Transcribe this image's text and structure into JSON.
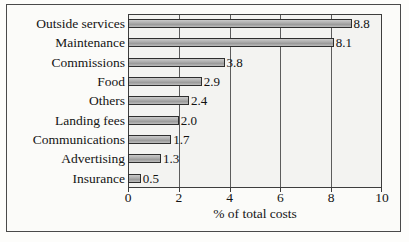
{
  "chart_data": {
    "type": "bar",
    "orientation": "horizontal",
    "title": "",
    "xlabel": "% of total costs",
    "ylabel": "",
    "xlim": [
      0,
      10
    ],
    "xticks": [
      0,
      2,
      4,
      6,
      8,
      10
    ],
    "xtick_labels": [
      "0",
      "2",
      "4",
      "6",
      "8",
      "10"
    ],
    "gridlines": [
      2,
      4,
      6,
      8
    ],
    "grid": true,
    "legend": false,
    "categories": [
      "Outside services",
      "Maintenance",
      "Commissions",
      "Food",
      "Others",
      "Landing fees",
      "Communications",
      "Advertising",
      "Insurance"
    ],
    "values": [
      8.8,
      8.1,
      3.8,
      2.9,
      2.4,
      2.0,
      1.7,
      1.3,
      0.5
    ],
    "value_labels": [
      "8.8",
      "8.1",
      "3.8",
      "2.9",
      "2.4",
      "2.0",
      "1.7",
      "1.3",
      "0.5"
    ],
    "colors": {
      "bar_fill": "#b2b2b2",
      "bar_edge": "#2e2e2e",
      "plot_background": "#f3f3f1",
      "figure_background": "#fbfbf9",
      "axis": "#3d3d3d",
      "text": "#141414"
    }
  }
}
